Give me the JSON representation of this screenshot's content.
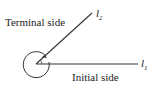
{
  "diagram": {
    "terminal_label": "Terminal side",
    "initial_label": "Initial side",
    "ray1": {
      "name": "l",
      "sub": "1"
    },
    "ray2": {
      "name": "l",
      "sub": "2"
    },
    "colors": {
      "stroke": "#333333",
      "text": "#222222"
    }
  }
}
